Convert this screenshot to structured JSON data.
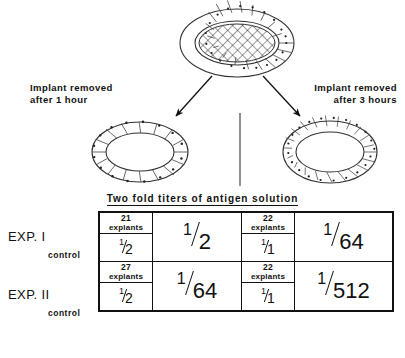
{
  "diagram": {
    "top_specimen": {
      "name": "explant-with-implant",
      "center_pattern": "cross-hatched implant",
      "ring_cell_count": 22
    },
    "branches": [
      {
        "id": "left",
        "caption_line1": "Implant removed",
        "caption_line2": "after 1 hour",
        "specimen_name": "explant-ring-1-hour",
        "ring_cell_count": 18
      },
      {
        "id": "right",
        "caption_line1": "Implant removed",
        "caption_line2": "after 3 hours",
        "specimen_name": "explant-ring-3-hours",
        "ring_cell_count": 26
      }
    ],
    "divider": "vertical-separator-line"
  },
  "table": {
    "title": "Two fold titers of antigen solution",
    "control_label": "control",
    "explants_word": "explants",
    "rows": [
      {
        "experiment_label": "EXP. I",
        "left": {
          "explant_count": "21",
          "control_numerator": "1",
          "control_denominator": "2",
          "titer_numerator": "1",
          "titer_denominator": "2"
        },
        "right": {
          "explant_count": "22",
          "control_numerator": "1",
          "control_denominator": "1",
          "titer_numerator": "1",
          "titer_denominator": "64"
        }
      },
      {
        "experiment_label": "EXP. II",
        "left": {
          "explant_count": "27",
          "control_numerator": "1",
          "control_denominator": "2",
          "titer_numerator": "1",
          "titer_denominator": "64"
        },
        "right": {
          "explant_count": "22",
          "control_numerator": "1",
          "control_denominator": "1",
          "titer_numerator": "1",
          "titer_denominator": "512"
        }
      }
    ]
  },
  "colors": {
    "ink": "#111111",
    "paper": "#ffffff"
  }
}
